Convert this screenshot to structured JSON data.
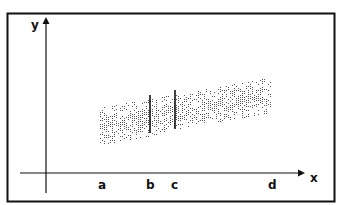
{
  "diagram": {
    "axes": {
      "y_label": "y",
      "x_label": "x"
    },
    "x_markers": [
      {
        "id": "a",
        "label": "a",
        "x": 102
      },
      {
        "id": "b",
        "label": "b",
        "x": 150
      },
      {
        "id": "c",
        "label": "c",
        "x": 175
      },
      {
        "id": "d",
        "label": "d",
        "x": 272
      }
    ],
    "vertical_cut_lines": [
      {
        "at": "b",
        "x": 150,
        "y_top": 95,
        "y_bottom": 133
      },
      {
        "at": "c",
        "x": 175,
        "y_top": 90,
        "y_bottom": 129
      }
    ],
    "scatter_band": {
      "description": "stippled band of dots rising from left to right",
      "x_start": 100,
      "x_end": 270,
      "left_y_range": [
        108,
        145
      ],
      "right_y_range": [
        78,
        112
      ]
    },
    "colors": {
      "ink": "#111111",
      "dots": "#555555",
      "background": "#ffffff"
    }
  }
}
